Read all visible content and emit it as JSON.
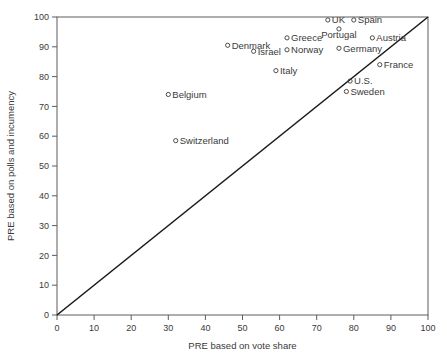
{
  "chart_data": {
    "type": "scatter",
    "title": "",
    "xlabel": "PRE based on vote share",
    "ylabel": "PRE based on polls and incumency",
    "xlim": [
      0,
      100
    ],
    "ylim": [
      0,
      100
    ],
    "xticks": [
      0,
      10,
      20,
      30,
      40,
      50,
      60,
      70,
      80,
      90,
      100
    ],
    "yticks": [
      0,
      10,
      20,
      30,
      40,
      50,
      60,
      70,
      80,
      90,
      100
    ],
    "xtick_labels": [
      "0",
      "10",
      "20",
      "30",
      "40",
      "50",
      "60",
      "70",
      "80",
      "90",
      "100"
    ],
    "ytick_labels": [
      "0",
      "10",
      "20",
      "30",
      "40",
      "50",
      "60",
      "70",
      "80",
      "90",
      "100"
    ],
    "grid": false,
    "legend": false,
    "marker_style": "open-circle",
    "reference_line": {
      "type": "identity",
      "from": [
        0,
        0
      ],
      "to": [
        100,
        100
      ],
      "color": "#1a1a1a"
    },
    "points": [
      {
        "label": "UK",
        "x": 73,
        "y": 99,
        "label_pos": "right"
      },
      {
        "label": "Spain",
        "x": 80,
        "y": 99,
        "label_pos": "right"
      },
      {
        "label": "Portugal",
        "x": 76,
        "y": 96,
        "label_pos": "below"
      },
      {
        "label": "Greece",
        "x": 62,
        "y": 93,
        "label_pos": "right"
      },
      {
        "label": "Austria",
        "x": 85,
        "y": 93,
        "label_pos": "right"
      },
      {
        "label": "Denmark",
        "x": 46,
        "y": 90.5,
        "label_pos": "right"
      },
      {
        "label": "Germany",
        "x": 76,
        "y": 89.5,
        "label_pos": "right"
      },
      {
        "label": "Norway",
        "x": 62,
        "y": 89,
        "label_pos": "right"
      },
      {
        "label": "Israel",
        "x": 53,
        "y": 88.5,
        "label_pos": "right"
      },
      {
        "label": "France",
        "x": 87,
        "y": 84,
        "label_pos": "right"
      },
      {
        "label": "Italy",
        "x": 59,
        "y": 82,
        "label_pos": "right"
      },
      {
        "label": "U.S.",
        "x": 79,
        "y": 78.5,
        "label_pos": "right"
      },
      {
        "label": "Sweden",
        "x": 78,
        "y": 75,
        "label_pos": "right"
      },
      {
        "label": "Belgium",
        "x": 30,
        "y": 74,
        "label_pos": "right"
      },
      {
        "label": "Switzerland",
        "x": 32,
        "y": 58.5,
        "label_pos": "right"
      }
    ]
  },
  "colors": {
    "axis": "#5c5c5c",
    "text": "#3a3a3a",
    "line": "#1a1a1a",
    "background": "#ffffff"
  }
}
